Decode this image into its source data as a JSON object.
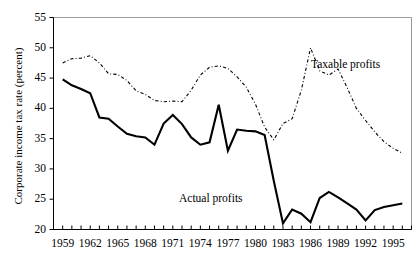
{
  "chart_data": {
    "type": "line",
    "title": "",
    "subtitle": "",
    "xlabel": "",
    "ylabel": "Corporate income tax rate (percent)",
    "xlim": [
      1958,
      1997
    ],
    "ylim": [
      20,
      55
    ],
    "grid": false,
    "legend_position": "inline-annotation",
    "y_ticks": [
      20,
      25,
      30,
      35,
      40,
      45,
      50,
      55
    ],
    "x_ticks": [
      1959,
      1962,
      1965,
      1968,
      1971,
      1974,
      1977,
      1980,
      1983,
      1986,
      1989,
      1992,
      1995
    ],
    "x_minor_ticks_every": 1,
    "x": [
      1959,
      1960,
      1961,
      1962,
      1963,
      1964,
      1965,
      1966,
      1967,
      1968,
      1969,
      1970,
      1971,
      1972,
      1973,
      1974,
      1975,
      1976,
      1977,
      1978,
      1979,
      1980,
      1981,
      1982,
      1983,
      1984,
      1985,
      1986,
      1987,
      1988,
      1989,
      1990,
      1991,
      1992,
      1993,
      1994,
      1995,
      1996
    ],
    "series": [
      {
        "name": "Actual profits",
        "style": "solid",
        "color": "#000000",
        "values": [
          44.8,
          43.8,
          43.2,
          42.5,
          38.5,
          38.3,
          37.0,
          35.8,
          35.4,
          35.2,
          34.0,
          37.5,
          38.9,
          37.4,
          35.2,
          34.0,
          34.4,
          40.6,
          33.0,
          36.5,
          36.3,
          36.2,
          35.6,
          28.0,
          21.0,
          23.3,
          22.6,
          21.2,
          25.2,
          26.2,
          25.3,
          24.3,
          23.3,
          21.5,
          23.2,
          23.7,
          24.0,
          24.3
        ]
      },
      {
        "name": "Taxable profits",
        "style": "dash-dot",
        "color": "#000000",
        "values": [
          47.5,
          48.2,
          48.3,
          48.7,
          47.5,
          45.7,
          45.6,
          44.6,
          42.9,
          42.3,
          41.3,
          41.1,
          41.2,
          41.1,
          43.0,
          45.5,
          46.8,
          47.0,
          46.6,
          45.2,
          43.5,
          40.7,
          36.9,
          34.8,
          37.5,
          38.3,
          43.0,
          50.0,
          46.2,
          45.5,
          46.5,
          43.4,
          40.0,
          38.0,
          36.1,
          34.5,
          33.4,
          32.6
        ]
      }
    ],
    "annotations": [
      {
        "text": "Taxable profits",
        "x_px": 311,
        "y_px": 58
      },
      {
        "text": "Actual profits",
        "x_px": 179,
        "y_px": 192
      }
    ]
  },
  "axes": {
    "y_title": "Corporate income tax rate (percent)"
  }
}
